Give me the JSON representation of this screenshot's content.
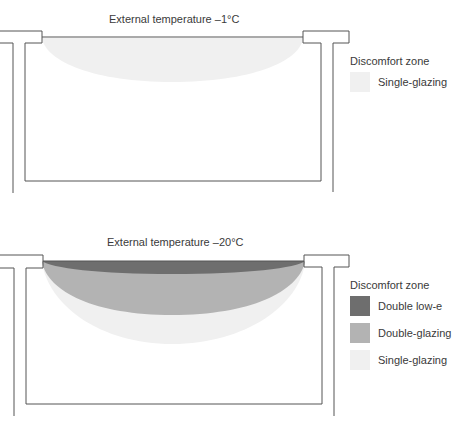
{
  "diagrams": [
    {
      "title": "External temperature –1°C",
      "legend": {
        "title": "Discomfort zone",
        "items": [
          {
            "label": "Single-glazing",
            "color": "#f0f0f0"
          }
        ]
      }
    },
    {
      "title": "External temperature –20°C",
      "legend": {
        "title": "Discomfort zone",
        "items": [
          {
            "label": "Double low-e",
            "color": "#6e6e6e"
          },
          {
            "label": "Double-glazing",
            "color": "#b3b3b3"
          },
          {
            "label": "Single-glazing",
            "color": "#f0f0f0"
          }
        ]
      }
    }
  ],
  "colors": {
    "line": "#555555",
    "double_low_e": "#6e6e6e",
    "double_glazing": "#b3b3b3",
    "single_glazing": "#f0f0f0"
  }
}
